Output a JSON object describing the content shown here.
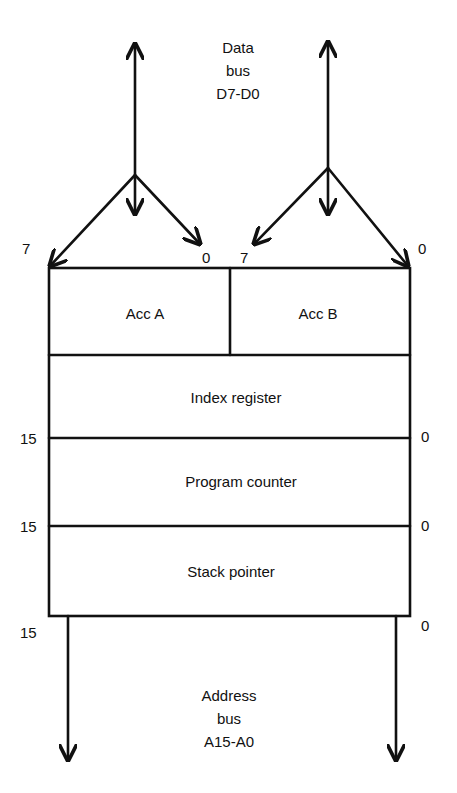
{
  "data_bus": {
    "line1": "Data",
    "line2": "bus",
    "line3": "D7-D0"
  },
  "address_bus": {
    "line1": "Address",
    "line2": "bus",
    "line3": "A15-A0"
  },
  "registers": {
    "acc_a": "Acc A",
    "acc_b": "Acc B",
    "index": "Index register",
    "pc": "Program counter",
    "sp": "Stack pointer"
  },
  "bit_labels": {
    "acc_a_msb": "7",
    "acc_a_lsb": "0",
    "acc_b_msb": "7",
    "acc_b_lsb": "0",
    "index_msb": "15",
    "index_lsb": "0",
    "pc_msb": "15",
    "pc_lsb": "0",
    "sp_msb": "15",
    "sp_lsb": "0"
  },
  "colors": {
    "line": "#111111",
    "background": "#ffffff"
  }
}
